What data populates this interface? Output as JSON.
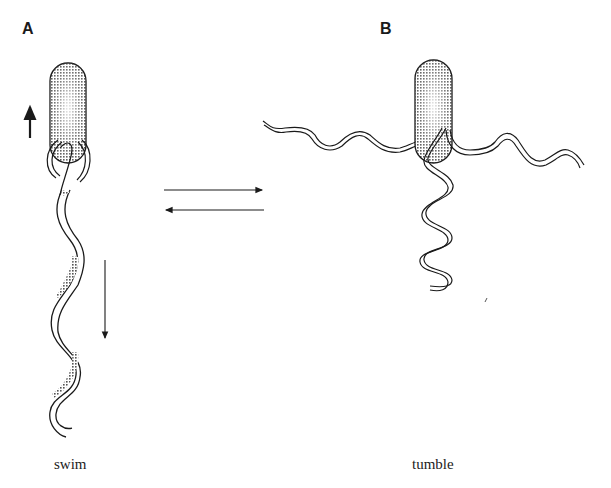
{
  "panels": {
    "a": {
      "label": "A",
      "caption": "swim"
    },
    "b": {
      "label": "B",
      "caption": "tumble"
    }
  },
  "arrows": {
    "forward": "A → B",
    "reverse": "B → A"
  },
  "colors": {
    "ink": "#1a1a1a",
    "cell_fill": "#c8c8c8",
    "background": "#ffffff"
  }
}
